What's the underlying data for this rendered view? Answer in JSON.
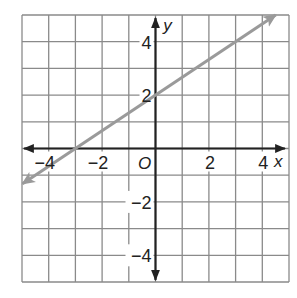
{
  "chart_data": {
    "type": "line",
    "title": "",
    "xlabel": "x",
    "ylabel": "y",
    "xlim": [
      -5,
      5
    ],
    "ylim": [
      -5,
      5
    ],
    "grid": true,
    "grid_step": 1,
    "x_ticks": [
      {
        "value": -4,
        "label": "−4"
      },
      {
        "value": -2,
        "label": "−2"
      },
      {
        "value": 2,
        "label": "2"
      },
      {
        "value": 4,
        "label": "4"
      }
    ],
    "y_ticks": [
      {
        "value": 4,
        "label": "4"
      },
      {
        "value": 2,
        "label": "2"
      },
      {
        "value": -2,
        "label": "−2"
      },
      {
        "value": -4,
        "label": "−4"
      }
    ],
    "origin_label": "O",
    "series": [
      {
        "name": "line",
        "equation": "y = (2/3)x + 2",
        "slope": 0.6667,
        "intercept": 2,
        "x": [
          -4.98,
          4.5
        ],
        "y": [
          -1.32,
          5.0
        ],
        "arrows": "both",
        "color": "#9a9a9a"
      }
    ],
    "colors": {
      "grid": "#8a8a8a",
      "axes": "#222222",
      "line": "#9a9a9a"
    }
  }
}
